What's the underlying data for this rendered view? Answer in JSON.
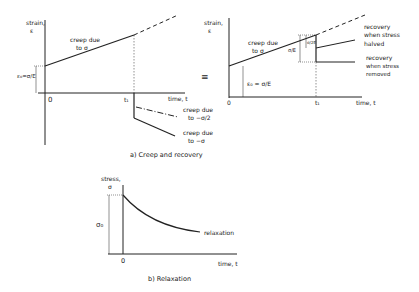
{
  "panel_a": {
    "caption": "a)  Creep and recovery",
    "left": {
      "y_label_1": "strain,",
      "y_label_2": "ε",
      "x_label": "time, t",
      "origin": "0",
      "t1": "t₁",
      "initial_strain": "ε₀=σ/E",
      "creep_label_1": "creep due",
      "creep_label_2": "to σ",
      "half_label_1": "creep due",
      "half_label_2": "to −σ/2",
      "full_label_1": "creep due",
      "full_label_2": "to −σ"
    },
    "equiv": "≡",
    "right": {
      "y_label_1": "strain,",
      "y_label_2": "ε",
      "x_label": "time, t",
      "origin": "0",
      "t1": "t₁",
      "initial_strain": "ε₀ = σ/E",
      "creep_label_1": "creep due",
      "creep_label_2": "to σ",
      "drop_full": "σ/E",
      "drop_half": "σ/2E",
      "halved_label_1": "recovery",
      "halved_label_2": "when stress",
      "halved_label_3": "halved",
      "removed_label_1": "recovery",
      "removed_label_2": "when stress",
      "removed_label_3": "removed"
    }
  },
  "panel_b": {
    "caption": "b)   Relaxation",
    "y_label_1": "stress,",
    "y_label_2": "σ",
    "sigma0": "σ₀",
    "origin": "0",
    "x_label": "time, t",
    "curve_label": "relaxation"
  }
}
